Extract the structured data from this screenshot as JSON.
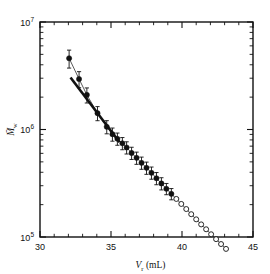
{
  "chart_data": {
    "type": "scatter",
    "title": "",
    "xlabel": "V_r (mL)",
    "xlabel_symbol": "V",
    "xlabel_sub": "r",
    "xlabel_unit": "(mL)",
    "ylabel": "Mw",
    "ylabel_symbol": "M",
    "ylabel_sub": "w",
    "xlim": [
      30,
      45
    ],
    "ylim": [
      100000,
      10000000
    ],
    "yscale": "log",
    "xscale": "linear",
    "grid": false,
    "legend": "none",
    "xticks": [
      30,
      35,
      40,
      45
    ],
    "xticklabels": [
      "30",
      "35",
      "40",
      "45"
    ],
    "yticks": [
      100000,
      1000000,
      10000000
    ],
    "yticklabels": [
      "10⁵",
      "10⁶",
      "10⁷"
    ],
    "ytick_bases": [
      "10",
      "10",
      "10"
    ],
    "ytick_exponents": [
      "5",
      "6",
      "7"
    ],
    "minor_ticks": true,
    "frame": "box",
    "tick_direction": "in",
    "series": [
      {
        "name": "filled-circles-with-error-bars",
        "marker": "filled circle",
        "has_error_bars": true,
        "x": [
          32.05,
          32.75,
          33.3,
          34.05,
          34.7,
          35.1,
          35.45,
          35.8,
          36.1,
          36.45,
          36.8,
          37.15,
          37.5,
          37.85,
          38.2,
          38.55,
          38.9,
          39.25
        ],
        "y": [
          4600000,
          2950000,
          2100000,
          1420000,
          1060000,
          905000,
          820000,
          745000,
          680000,
          605000,
          545000,
          490000,
          440000,
          396000,
          352000,
          315000,
          281000,
          252000
        ],
        "yerr_frac": [
          0.19,
          0.17,
          0.16,
          0.15,
          0.14,
          0.14,
          0.13,
          0.13,
          0.13,
          0.13,
          0.13,
          0.13,
          0.13,
          0.13,
          0.13,
          0.13,
          0.12,
          0.12
        ]
      },
      {
        "name": "open-circles",
        "marker": "open circle",
        "has_error_bars": false,
        "x": [
          39.6,
          39.95,
          40.3,
          40.65,
          41.0,
          41.35,
          41.7,
          42.05,
          42.4,
          42.75,
          43.1
        ],
        "y": [
          226000,
          203000,
          182000,
          163000,
          146000,
          131000,
          118000,
          106000,
          95500,
          86000,
          77500
        ]
      }
    ],
    "lines": [
      {
        "name": "connecting-curve",
        "style": "thin solid through markers"
      },
      {
        "name": "reference-line",
        "style": "thick straight",
        "x": [
          32.15,
          35.6
        ],
        "y": [
          3050000,
          760000
        ]
      }
    ]
  },
  "figure": {
    "background_color": "#ffffff",
    "ink_color": "#111111"
  }
}
